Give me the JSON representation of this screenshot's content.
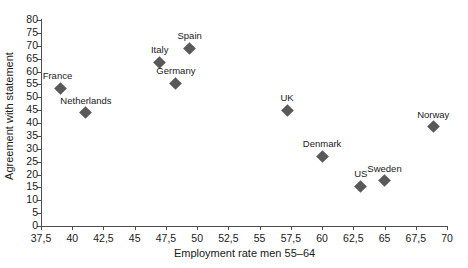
{
  "chart_data": {
    "type": "scatter",
    "title": "",
    "xlabel": "Employment rate men 55–64",
    "ylabel": "Agreement with statement",
    "xlim": [
      37.5,
      70
    ],
    "ylim": [
      0,
      80
    ],
    "xticks": [
      37.5,
      40,
      42.5,
      45,
      47.5,
      50,
      52.5,
      55,
      57.5,
      60,
      62.5,
      65,
      67.5,
      70
    ],
    "xticklabels": [
      "37,5",
      "40",
      "42,5",
      "45",
      "47,5",
      "50",
      "52,5",
      "55",
      "57,5",
      "60",
      "62,5",
      "65",
      "67,5",
      "70"
    ],
    "yticks": [
      0,
      5,
      10,
      15,
      20,
      25,
      30,
      35,
      40,
      45,
      50,
      55,
      60,
      65,
      70,
      75,
      80
    ],
    "yticklabels": [
      "0",
      "5",
      "10",
      "15",
      "20",
      "25",
      "30",
      "35",
      "40",
      "45",
      "50",
      "55",
      "60",
      "65",
      "70",
      "75",
      "80"
    ],
    "grid": false,
    "legend": "none",
    "marker": "diamond",
    "marker_color": "#595959",
    "axis_color": "#4d4d4d",
    "text_color": "#1a1a1a",
    "background": "#ffffff",
    "points": [
      {
        "label": "France",
        "x": 39.1,
        "y": 53.5,
        "label_pos": "above-left"
      },
      {
        "label": "Netherlands",
        "x": 41.1,
        "y": 44.0,
        "label_pos": "above"
      },
      {
        "label": "Italy",
        "x": 47.0,
        "y": 63.5,
        "label_pos": "above"
      },
      {
        "label": "Germany",
        "x": 48.3,
        "y": 55.5,
        "label_pos": "above"
      },
      {
        "label": "Spain",
        "x": 49.4,
        "y": 69.0,
        "label_pos": "above"
      },
      {
        "label": "UK",
        "x": 57.2,
        "y": 45.0,
        "label_pos": "above"
      },
      {
        "label": "Denmark",
        "x": 60.0,
        "y": 27.0,
        "label_pos": "above"
      },
      {
        "label": "US",
        "x": 63.1,
        "y": 15.5,
        "label_pos": "above"
      },
      {
        "label": "Sweden",
        "x": 65.0,
        "y": 17.5,
        "label_pos": "above"
      },
      {
        "label": "Norway",
        "x": 68.9,
        "y": 38.5,
        "label_pos": "above"
      }
    ]
  }
}
